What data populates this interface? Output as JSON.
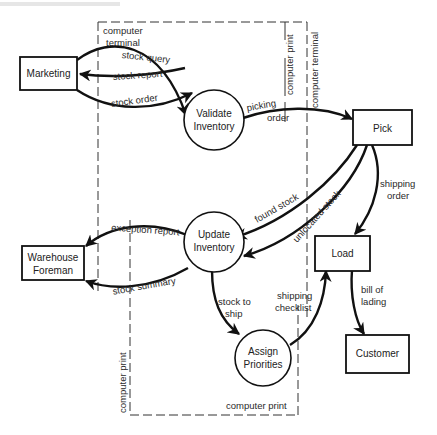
{
  "diagram": {
    "type": "data-flow-diagram",
    "external_entities": [
      {
        "id": "marketing",
        "label": "Marketing"
      },
      {
        "id": "pick",
        "label": "Pick"
      },
      {
        "id": "warehouse_foreman",
        "label_line1": "Warehouse",
        "label_line2": "Foreman"
      },
      {
        "id": "load",
        "label": "Load"
      },
      {
        "id": "customer",
        "label": "Customer"
      }
    ],
    "processes": [
      {
        "id": "validate_inventory",
        "label_line1": "Validate",
        "label_line2": "Inventory"
      },
      {
        "id": "update_inventory",
        "label_line1": "Update",
        "label_line2": "Inventory"
      },
      {
        "id": "assign_priorities",
        "label_line1": "Assign",
        "label_line2": "Priorities"
      }
    ],
    "flows": [
      {
        "from": "marketing",
        "to": "validate_inventory",
        "label": "stock query"
      },
      {
        "from": "validate_inventory",
        "to": "marketing",
        "label": "stock report"
      },
      {
        "from": "marketing",
        "to": "validate_inventory",
        "label": "stock order"
      },
      {
        "from": "validate_inventory",
        "to": "pick",
        "label_line1": "picking",
        "label_line2": "order"
      },
      {
        "from": "pick",
        "to": "update_inventory",
        "label": "found stock"
      },
      {
        "from": "pick",
        "to": "update_inventory",
        "label": "unlocated stock"
      },
      {
        "from": "pick",
        "to": "load",
        "label_line1": "shipping",
        "label_line2": "order"
      },
      {
        "from": "update_inventory",
        "to": "warehouse_foreman",
        "label": "exception report"
      },
      {
        "from": "update_inventory",
        "to": "warehouse_foreman",
        "label": "stock summary"
      },
      {
        "from": "update_inventory",
        "to": "assign_priorities",
        "label_line1": "stock to",
        "label_line2": "ship"
      },
      {
        "from": "assign_priorities",
        "to": "load",
        "label_line1": "shipping",
        "label_line2": "checklist"
      },
      {
        "from": "load",
        "to": "customer",
        "label_line1": "bill of",
        "label_line2": "lading"
      }
    ],
    "boundaries": {
      "terminal_top_left_line1": "computer",
      "terminal_top_left_line2": "terminal",
      "print_top_right": "computer print",
      "terminal_top_right": "computer terminal",
      "print_bottom_left": "computer print",
      "print_bottom": "computer print"
    }
  }
}
